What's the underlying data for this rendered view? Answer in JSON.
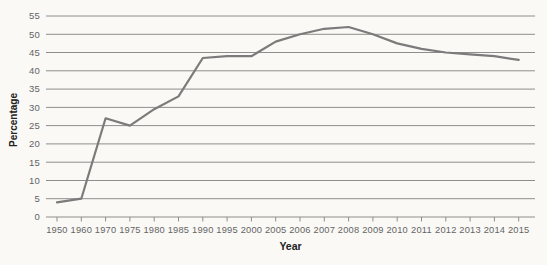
{
  "chart_data": {
    "type": "line",
    "xlabel": "Year",
    "ylabel": "Percentage",
    "categories": [
      "1950",
      "1960",
      "1970",
      "1975",
      "1980",
      "1985",
      "1990",
      "1995",
      "2000",
      "2005",
      "2006",
      "2007",
      "2008",
      "2009",
      "2010",
      "2011",
      "2012",
      "2013",
      "2014",
      "2015"
    ],
    "values": [
      4,
      5,
      27,
      25,
      29.5,
      33,
      43.5,
      44,
      44,
      48,
      50,
      51.5,
      52,
      50,
      47.5,
      46,
      45,
      44.5,
      44,
      43
    ],
    "ylim": [
      0,
      55
    ],
    "yticks": [
      0,
      5,
      10,
      15,
      20,
      25,
      30,
      35,
      40,
      45,
      50,
      55
    ],
    "grid": "horizontal",
    "legend_position": "none",
    "colors": {
      "line": "#7b7b7b",
      "grid": "#8e8e8e",
      "tick_label": "#646464",
      "axis_title": "#222222",
      "background": "#faf9f6"
    }
  }
}
